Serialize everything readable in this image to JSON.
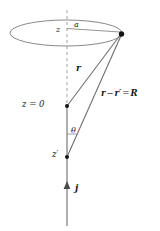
{
  "figure": {
    "domain": "Diagram",
    "width": 160,
    "height": 231,
    "background_color": "#ffffff",
    "line_color": "#7a7a7a",
    "text_color": "#1a1a1a",
    "point_color": "#111111"
  },
  "labels": {
    "loop_radius": "a",
    "loop_height": "z",
    "vector_r": "r",
    "difference_vector": {
      "full": "r − r′ = R",
      "term1": "r",
      "minus": "−",
      "term2": "r′",
      "equals": "=",
      "result": "R"
    },
    "origin": "z = 0",
    "angle": "θ",
    "source_height": "z′",
    "current_density": "j"
  },
  "geometry": {
    "axis_x": 67,
    "ellipse": {
      "cx": 66,
      "cy": 33,
      "rx": 56,
      "ry": 13,
      "stroke": "#7a7a7a",
      "dash": "none"
    },
    "dashed_axis": {
      "x": 67,
      "y_top": 10,
      "y_bottom": 106,
      "dash": "3,3",
      "stroke": "#9a9a9a"
    },
    "solid_axis": {
      "x": 67,
      "y_top": 106,
      "y_bottom": 226,
      "stroke": "#8a8a8a"
    },
    "radius_line": {
      "x1": 67,
      "y1": 28,
      "x2": 121,
      "y2": 32,
      "stroke": "#7a7a7a"
    },
    "vector_r_line": {
      "x1": 67,
      "y1": 106,
      "x2": 122,
      "y2": 34,
      "stroke": "#6f6f6f"
    },
    "vector_R_line": {
      "x1": 67,
      "y1": 157,
      "x2": 122,
      "y2": 34,
      "stroke": "#6f6f6f"
    },
    "angle_tick": {
      "x1": 67,
      "y1": 134,
      "x2": 78,
      "y2": 134,
      "stroke": "#8a8a8a"
    },
    "points": [
      {
        "name": "field-point",
        "x": 122,
        "y": 34,
        "r": 2.6
      },
      {
        "name": "origin-point",
        "x": 67,
        "y": 106,
        "r": 2.0
      },
      {
        "name": "source-point",
        "x": 67,
        "y": 157,
        "r": 2.0
      }
    ],
    "current_arrow": {
      "x": 67,
      "tip_y": 182,
      "tail_y": 226,
      "head_width": 5,
      "head_height": 7
    }
  }
}
